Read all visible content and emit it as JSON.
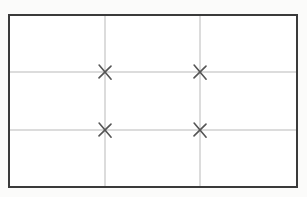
{
  "figure": {
    "title": "Rule of Thirds Composition Grid",
    "canvas": {
      "width": 307,
      "height": 197
    }
  },
  "colors": {
    "page_background": "#fbfbfa",
    "frame_fill": "#ffffff",
    "frame_border": "#3a3a3a",
    "grid_line": "#b9b9b9",
    "marker": "#555555"
  },
  "frame": {
    "name": "composition-frame",
    "x": 8,
    "y": 14,
    "width": 290,
    "height": 174,
    "border_width": 2
  },
  "grid": {
    "columns": 3,
    "rows": 3,
    "line_width": 1,
    "vertical_lines": [
      {
        "id": "vertical-line-1",
        "x": 105
      },
      {
        "id": "vertical-line-2",
        "x": 200
      }
    ],
    "horizontal_lines": [
      {
        "id": "horizontal-line-1",
        "y": 72
      },
      {
        "id": "horizontal-line-2",
        "y": 130
      }
    ]
  },
  "markers": {
    "type": "x-cross",
    "size": 13,
    "stroke_width": 1.6,
    "points": [
      {
        "id": "marker-top-left",
        "label": "Top left intersection",
        "x": 105,
        "y": 72
      },
      {
        "id": "marker-top-right",
        "label": "Top right intersection",
        "x": 200,
        "y": 72
      },
      {
        "id": "marker-bottom-left",
        "label": "Bottom left intersection",
        "x": 105,
        "y": 130
      },
      {
        "id": "marker-bottom-right",
        "label": "Bottom right intersection",
        "x": 200,
        "y": 130
      }
    ]
  }
}
